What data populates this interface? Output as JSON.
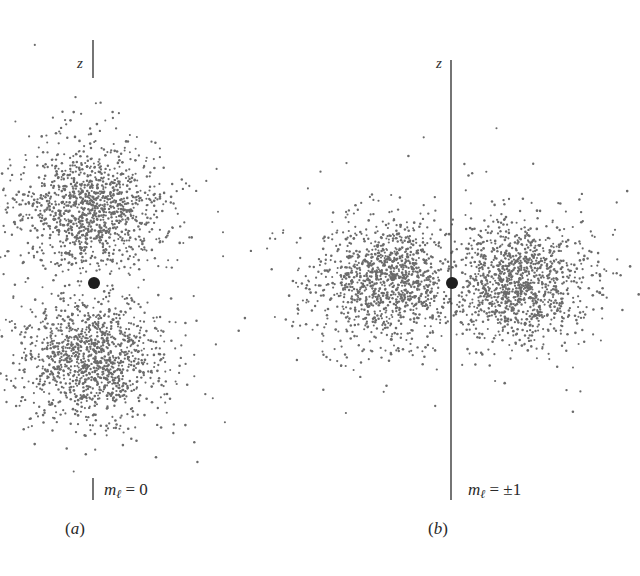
{
  "figure": {
    "colors": {
      "dots": "#6b6b6b",
      "nucleus": "#1e1e1e",
      "axis": "#3a3a3a",
      "background": "#ffffff"
    },
    "panels": [
      {
        "id": "a",
        "axis_label": "z",
        "ml_symbol": "m",
        "ml_subscript": "ℓ",
        "ml_value": " = 0",
        "caption_open": "(",
        "caption_letter": "a",
        "caption_close": ")",
        "shape": "two lobes along z-axis (dumbbell)",
        "nucleus": {
          "x": 94,
          "y": 283,
          "r": 6
        },
        "axis": {
          "x": 93,
          "segments": [
            [
              40,
              78
            ],
            [
              478,
              500
            ]
          ]
        },
        "lobes": [
          {
            "cx": 93,
            "cy": 208,
            "sx": 34,
            "sy": 30,
            "n": 1000,
            "halo_sx": 52,
            "halo_sy": 48,
            "halo_n": 260
          },
          {
            "cx": 93,
            "cy": 358,
            "sx": 34,
            "sy": 30,
            "n": 1000,
            "halo_sx": 52,
            "halo_sy": 48,
            "halo_n": 260
          }
        ]
      },
      {
        "id": "b",
        "axis_label": "z",
        "ml_symbol": "m",
        "ml_subscript": "ℓ",
        "ml_value": " = ±1",
        "caption_open": "(",
        "caption_letter": "b",
        "caption_close": ")",
        "shape": "torus around z-axis (seen edge-on as two lobes)",
        "nucleus": {
          "x": 452,
          "y": 283,
          "r": 6
        },
        "axis": {
          "x": 451,
          "segments": [
            [
              60,
              500
            ]
          ]
        },
        "lobes": [
          {
            "cx": 388,
            "cy": 281,
            "sx": 34,
            "sy": 28,
            "n": 1000,
            "halo_sx": 58,
            "halo_sy": 46,
            "halo_n": 260
          },
          {
            "cx": 516,
            "cy": 281,
            "sx": 34,
            "sy": 28,
            "n": 1000,
            "halo_sx": 58,
            "halo_sy": 46,
            "halo_n": 260
          }
        ]
      }
    ]
  }
}
